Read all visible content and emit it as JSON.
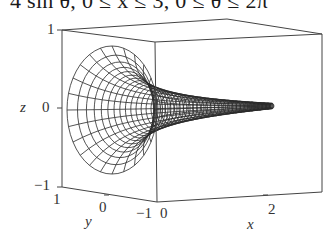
{
  "caption": "4 sin θ, 0 ≤ x ≤ 3, 0 ≤ θ ≤ 2π",
  "axes": {
    "z": {
      "label": "z",
      "ticks": [
        "1",
        "0",
        "−1"
      ]
    },
    "y": {
      "label": "y",
      "ticks": [
        "1",
        "0",
        "−1"
      ]
    },
    "x": {
      "label": "x",
      "ticks": [
        "0",
        "2"
      ]
    }
  },
  "colors": {
    "line": "#2a2a2a",
    "box": "#444444",
    "background": "#ffffff"
  },
  "surface": {
    "type": "horn",
    "x_range": [
      0,
      3
    ],
    "theta_range": "0 to 2π",
    "description": "Surface of revolution about the x-axis, radius shrinking from 1 at x=0 to near 0 at x=3"
  }
}
